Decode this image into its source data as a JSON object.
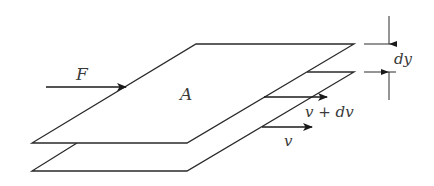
{
  "diagram": {
    "title": "",
    "colors": {
      "stroke": "#2a2a2a",
      "label": "#3a3a3a",
      "background": "#ffffff"
    },
    "labels": {
      "force": "F",
      "area": "A",
      "upper_velocity": "v + dv",
      "lower_velocity": "v",
      "separation": "dy"
    },
    "elements": {
      "top_plate": {
        "points": [
          [
            196,
            44
          ],
          [
            354,
            44
          ],
          [
            187,
            143
          ],
          [
            32,
            143
          ]
        ]
      },
      "bottom_plate": {
        "points": [
          [
            196,
            72
          ],
          [
            354,
            72
          ],
          [
            187,
            171
          ],
          [
            32,
            171
          ]
        ]
      },
      "force_arrow": {
        "from": [
          46,
          87
        ],
        "to": [
          126,
          87
        ]
      },
      "upper_velocity_arrow": {
        "from": [
          264,
          97
        ],
        "to": [
          327,
          97
        ]
      },
      "lower_velocity_arrow": {
        "from": [
          262,
          127
        ],
        "to": [
          312,
          127
        ]
      },
      "dimension": {
        "x": 389,
        "top_y": 44,
        "bottom_y": 72,
        "ext_x1": 364,
        "ext_x2": 396
      }
    }
  }
}
